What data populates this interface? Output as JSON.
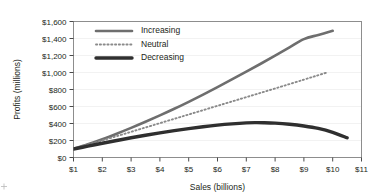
{
  "chart_data": {
    "type": "line",
    "title": "",
    "xlabel": "Sales (billions)",
    "ylabel": "Profits (millions)",
    "xlim": [
      1,
      11
    ],
    "ylim": [
      0,
      1600
    ],
    "grid": "horizontal-faint",
    "legend_position": "inside-top-left",
    "x_tick_labels": [
      "$1",
      "$2",
      "$3",
      "$4",
      "$5",
      "$6",
      "$7",
      "$8",
      "$9",
      "$10",
      "$11"
    ],
    "x_tick_values": [
      1,
      2,
      3,
      4,
      5,
      6,
      7,
      8,
      9,
      10,
      11
    ],
    "y_tick_labels": [
      "$0",
      "$200",
      "$400",
      "$600",
      "$800",
      "$1,000",
      "$1,200",
      "$1,400",
      "$1,600"
    ],
    "y_tick_values": [
      0,
      200,
      400,
      600,
      800,
      1000,
      1200,
      1400,
      1600
    ],
    "series": [
      {
        "name": "Increasing",
        "color": "#6e6e6e",
        "style": "solid",
        "width": 2.6,
        "x": [
          1.0,
          1.5,
          2.0,
          2.5,
          3.0,
          3.5,
          4.0,
          4.5,
          5.0,
          5.5,
          6.0,
          6.5,
          7.0,
          7.5,
          8.0,
          8.5,
          9.0,
          9.5,
          10.0
        ],
        "values": [
          100,
          155,
          215,
          280,
          348,
          420,
          495,
          573,
          655,
          740,
          828,
          918,
          1010,
          1103,
          1198,
          1295,
          1393,
          1442,
          1490
        ]
      },
      {
        "name": "Neutral",
        "color": "#8a8a8a",
        "style": "dotted",
        "width": 1.9,
        "x": [
          1.0,
          1.5,
          2.0,
          2.5,
          3.0,
          3.5,
          4.0,
          4.5,
          5.0,
          5.5,
          6.0,
          6.5,
          7.0,
          7.5,
          8.0,
          8.5,
          9.0,
          9.4,
          9.8
        ],
        "values": [
          100,
          150,
          200,
          251,
          302,
          353,
          404,
          455,
          506,
          557,
          608,
          659,
          710,
          761,
          812,
          864,
          916,
          958,
          1000
        ]
      },
      {
        "name": "Decreasing",
        "color": "#2f2f2f",
        "style": "solid",
        "width": 3.4,
        "x": [
          1.0,
          1.5,
          2.0,
          2.5,
          3.0,
          3.5,
          4.0,
          4.5,
          5.0,
          5.5,
          6.0,
          6.5,
          7.0,
          7.3,
          7.6,
          8.0,
          8.5,
          9.0,
          9.5,
          10.0,
          10.5
        ],
        "values": [
          100,
          133,
          168,
          200,
          232,
          262,
          290,
          316,
          340,
          362,
          381,
          396,
          407,
          410,
          409,
          404,
          391,
          371,
          342,
          296,
          232
        ]
      }
    ]
  },
  "legend": {
    "items": [
      {
        "label": "Increasing"
      },
      {
        "label": "Neutral"
      },
      {
        "label": "Decreasing"
      }
    ]
  },
  "axes": {
    "x_title": "Sales (billions)",
    "y_title": "Profits (millions)"
  },
  "marks": {
    "corner_crosshair": "crosshair-mark"
  }
}
